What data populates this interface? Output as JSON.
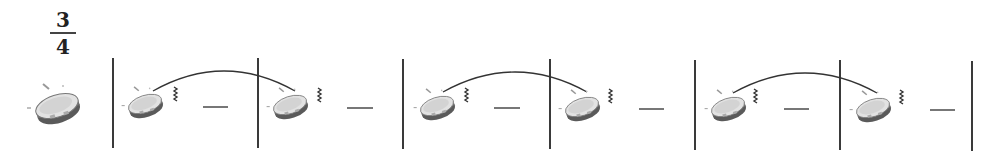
{
  "notation": {
    "instrument": "tambourine",
    "time_signature": {
      "numerator": "3",
      "denominator": "4"
    },
    "colors": {
      "ink": "#333333",
      "barline": "#3a3a3a",
      "rest": "#555555",
      "drum_body": "#7a7a7a",
      "drum_head": "#d8d8d8"
    },
    "leading_instrument_icon": {
      "x": 57,
      "y": 105
    },
    "barlines_x": [
      113,
      258,
      403,
      550,
      695,
      840,
      972
    ],
    "barline_y": [
      58,
      148
    ],
    "measures": [
      {
        "index": 1,
        "beat": {
          "icon": "tambourine-shake",
          "x": 145,
          "y": 103
        },
        "rest": {
          "x1": 203,
          "x2": 228,
          "y": 107
        }
      },
      {
        "index": 2,
        "beat": {
          "icon": "tambourine-shake",
          "x": 290,
          "y": 104
        },
        "rest": {
          "x1": 347,
          "x2": 373,
          "y": 108
        }
      },
      {
        "index": 3,
        "beat": {
          "icon": "tambourine-shake",
          "x": 437,
          "y": 105
        },
        "rest": {
          "x1": 494,
          "x2": 520,
          "y": 108
        }
      },
      {
        "index": 4,
        "beat": {
          "icon": "tambourine-shake",
          "x": 582,
          "y": 106
        },
        "rest": {
          "x1": 639,
          "x2": 664,
          "y": 109
        }
      },
      {
        "index": 5,
        "beat": {
          "icon": "tambourine-shake",
          "x": 728,
          "y": 106
        },
        "rest": {
          "x1": 784,
          "x2": 809,
          "y": 109
        }
      },
      {
        "index": 6,
        "beat": {
          "icon": "tambourine-shake",
          "x": 873,
          "y": 107
        },
        "rest": {
          "x1": 930,
          "x2": 955,
          "y": 110
        }
      }
    ],
    "ties": [
      {
        "from_measure": 1,
        "to_measure": 2,
        "x1": 153,
        "x2": 295,
        "y_end": 91,
        "y_peak": 71
      },
      {
        "from_measure": 3,
        "to_measure": 4,
        "x1": 443,
        "x2": 587,
        "y_end": 92,
        "y_peak": 72
      },
      {
        "from_measure": 5,
        "to_measure": 6,
        "x1": 733,
        "x2": 877,
        "y_end": 93,
        "y_peak": 73
      }
    ]
  }
}
